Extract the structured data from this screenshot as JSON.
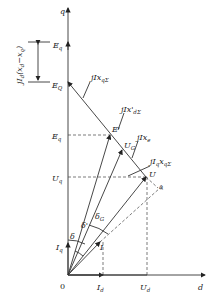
{
  "diagram": {
    "type": "phasor-diagram",
    "axes": {
      "q": "q",
      "d": "d",
      "origin": "0"
    },
    "phasors": [
      {
        "name": "E_q",
        "label": "Ėq"
      },
      {
        "name": "E_Q",
        "label": "ĖQ"
      },
      {
        "name": "E_q_prime",
        "label": "Ė'q"
      },
      {
        "name": "E_prime",
        "label": "Ė'"
      },
      {
        "name": "U_G",
        "label": "U̇G"
      },
      {
        "name": "U",
        "label": "U̇"
      },
      {
        "name": "U_q",
        "label": "U̇q"
      },
      {
        "name": "U_d",
        "label": "U̇d"
      },
      {
        "name": "I",
        "label": "İ"
      },
      {
        "name": "I_q",
        "label": "İq"
      },
      {
        "name": "I_d",
        "label": "İd"
      }
    ],
    "drops": [
      {
        "name": "jIxqΣ",
        "label": "jİxqΣ"
      },
      {
        "name": "jIx'dΣ",
        "label": "jİx'dΣ"
      },
      {
        "name": "jIxe",
        "label": "jİxe"
      },
      {
        "name": "jIqxqΣ",
        "label": "jİqxqΣ"
      },
      {
        "name": "jId(xd-xq)",
        "label": "jİd(xd−xq)"
      }
    ],
    "angles": [
      "δ",
      "δ'",
      "δG",
      "φ"
    ]
  },
  "labels": {
    "q": "q",
    "d": "d",
    "o": "0",
    "Eq": "E",
    "Eq_sub": "q",
    "EQ": "E",
    "EQ_sub": "Q",
    "Eqp": "E",
    "Eqp_sub": "q",
    "Ep": "E'",
    "UG": "U",
    "UG_sub": "G",
    "U": "U",
    "Uq": "U",
    "Uq_sub": "q",
    "Ud": "U",
    "Ud_sub": "d",
    "I": "I",
    "Iq": "I",
    "Iq_sub": "q",
    "Id": "I",
    "Id_sub": "d",
    "jIxqS": "jIx",
    "jIxqS_sub": "qΣ",
    "jIxdS": "jIx'",
    "jIxdS_sub": "dΣ",
    "jIxe": "jIx",
    "jIxe_sub": "e",
    "jIqxqS": "jI",
    "jIqxqS_sub1": "q",
    "jIqxqS_mid": "x",
    "jIqxqS_sub2": "qΣ",
    "jIdxdxq": "jI",
    "jIdxdxq_sub": "d",
    "jIdxdxq_rest": "(x",
    "jIdxdxq_d": "d",
    "jIdxdxq_minus": "−x",
    "jIdxdxq_q": "q",
    "jIdxdxq_close": ")",
    "delta": "δ",
    "deltap": "δ'",
    "deltaG": "δ",
    "deltaG_sub": "G",
    "phi": "φ"
  }
}
